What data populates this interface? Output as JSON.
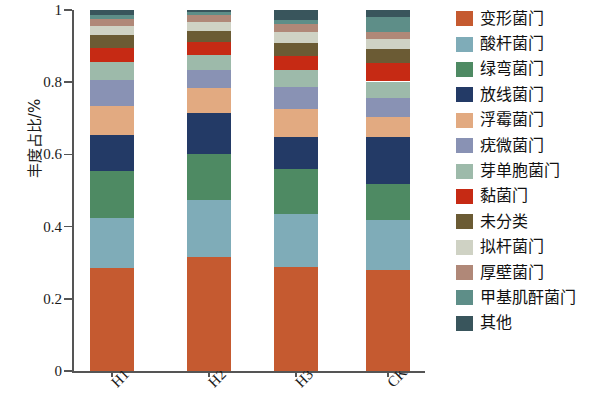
{
  "chart_data": {
    "type": "bar",
    "subtype": "stacked-bar-100",
    "title": "",
    "xlabel": "",
    "ylabel": "丰度占比/%",
    "ylim": [
      0,
      1
    ],
    "yticks": [
      "0",
      "0.2",
      "0.4",
      "0.6",
      "0.8",
      "1"
    ],
    "ytick_values": [
      0,
      0.2,
      0.4,
      0.6,
      0.8,
      1
    ],
    "grid": false,
    "legend_position": "right",
    "categories": [
      "H1",
      "H2",
      "H3",
      "CK"
    ],
    "series": [
      {
        "name": "变形菌门",
        "color": "#C55A30",
        "values": [
          0.285,
          0.315,
          0.287,
          0.281
        ]
      },
      {
        "name": "酸杆菌门",
        "color": "#7FACB8",
        "values": [
          0.14,
          0.16,
          0.147,
          0.136
        ]
      },
      {
        "name": "绿弯菌门",
        "color": "#4E8A63",
        "values": [
          0.13,
          0.125,
          0.125,
          0.1
        ]
      },
      {
        "name": "放线菌门",
        "color": "#233A66",
        "values": [
          0.1,
          0.115,
          0.09,
          0.13
        ]
      },
      {
        "name": "浮霉菌门",
        "color": "#E2AA81",
        "values": [
          0.08,
          0.07,
          0.077,
          0.057
        ]
      },
      {
        "name": "疣微菌门",
        "color": "#8992B4",
        "values": [
          0.07,
          0.05,
          0.06,
          0.052
        ]
      },
      {
        "name": "芽单胞菌门",
        "color": "#9DBAAA",
        "values": [
          0.05,
          0.04,
          0.048,
          0.046
        ]
      },
      {
        "name": "黏菌门",
        "color": "#C62A14",
        "values": [
          0.04,
          0.037,
          0.039,
          0.052
        ]
      },
      {
        "name": "未分类",
        "color": "#6B5B34",
        "values": [
          0.035,
          0.03,
          0.036,
          0.037
        ]
      },
      {
        "name": "拟杆菌门",
        "color": "#CFD2C4",
        "values": [
          0.025,
          0.026,
          0.029,
          0.03
        ]
      },
      {
        "name": "厚壁菌门",
        "color": "#B08878",
        "values": [
          0.02,
          0.017,
          0.022,
          0.019
        ]
      },
      {
        "name": "甲基肌酐菌门",
        "color": "#5E8E88",
        "values": [
          0.01,
          0.01,
          0.012,
          0.04
        ]
      },
      {
        "name": "其他",
        "color": "#39555C",
        "values": [
          0.015,
          0.005,
          0.028,
          0.02
        ]
      }
    ]
  },
  "legend": {
    "items": [
      {
        "label": "变形菌门",
        "color": "#C55A30"
      },
      {
        "label": "酸杆菌门",
        "color": "#7FACB8"
      },
      {
        "label": "绿弯菌门",
        "color": "#4E8A63"
      },
      {
        "label": "放线菌门",
        "color": "#233A66"
      },
      {
        "label": "浮霉菌门",
        "color": "#E2AA81"
      },
      {
        "label": "疣微菌门",
        "color": "#8992B4"
      },
      {
        "label": "芽单胞菌门",
        "color": "#9DBAAA"
      },
      {
        "label": "黏菌门",
        "color": "#C62A14"
      },
      {
        "label": "未分类",
        "color": "#6B5B34"
      },
      {
        "label": "拟杆菌门",
        "color": "#CFD2C4"
      },
      {
        "label": "厚壁菌门",
        "color": "#B08878"
      },
      {
        "label": "甲基肌酐菌门",
        "color": "#5E8E88"
      },
      {
        "label": "其他",
        "color": "#39555C"
      }
    ]
  },
  "axes": {
    "y_title": "丰度占比/%",
    "y_ticks": [
      "1",
      "0.8",
      "0.6",
      "0.4",
      "0.2",
      "0"
    ],
    "x_ticks": [
      "H1",
      "H2",
      "H3",
      "CK"
    ]
  }
}
